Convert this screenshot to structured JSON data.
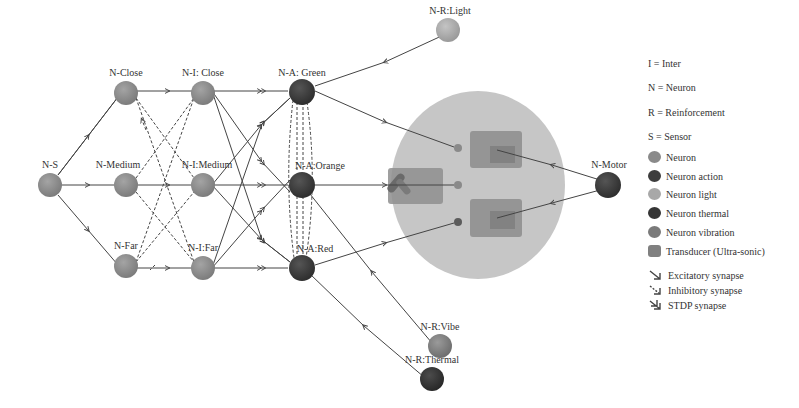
{
  "nodes": {
    "ns": {
      "label": "N-S"
    },
    "close": {
      "label": "N-Close"
    },
    "medium": {
      "label": "N-Medium"
    },
    "far": {
      "label": "N-Far"
    },
    "i_close": {
      "label": "N-I: Close"
    },
    "i_medium": {
      "label": "N-I:Medium"
    },
    "i_far": {
      "label": "N-I:Far"
    },
    "a_green": {
      "label": "N-A: Green"
    },
    "a_orange": {
      "label": "N-A:Orange"
    },
    "a_red": {
      "label": "N-A:Red"
    },
    "r_light": {
      "label": "N-R:Light"
    },
    "r_vibe": {
      "label": "N-R:Vibe"
    },
    "r_thermal": {
      "label": "N-R:Thermal"
    },
    "motor": {
      "label": "N-Motor"
    }
  },
  "legend": {
    "abbreviations": [
      {
        "text": "I = Inter"
      },
      {
        "text": "N = Neuron"
      },
      {
        "text": "R = Reinforcement"
      },
      {
        "text": "S = Sensor"
      }
    ],
    "node_types": [
      {
        "label": "Neuron",
        "color": "#8a8a8a"
      },
      {
        "label": "Neuron action",
        "color": "#3d3d3d"
      },
      {
        "label": "Neuron light",
        "color": "#a8a8a8"
      },
      {
        "label": "Neuron thermal",
        "color": "#353535"
      },
      {
        "label": "Neuron vibration",
        "color": "#7a7a7a"
      },
      {
        "label": "Transducer (Ultra-sonic)",
        "color": "#808080"
      }
    ],
    "synapses": [
      {
        "label": "Excitatory synapse"
      },
      {
        "label": "Inhibitory synapse"
      },
      {
        "label": "STDP synapse"
      }
    ]
  },
  "colors": {
    "neuron": "#8a8a8a",
    "action": "#3a3a3a",
    "light": "#aaaaaa",
    "thermal": "#333333",
    "vibration": "#7c7c7c",
    "robot_body": "#c4c4c4",
    "transducer": "#8c8c8c",
    "line": "#444444"
  }
}
